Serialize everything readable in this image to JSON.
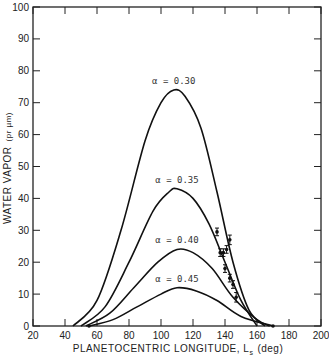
{
  "chart_data": {
    "type": "line",
    "title": "",
    "xlabel": "PLANETOCENTRIC LONGITUDE, Ls (deg)",
    "ylabel": "WATER VAPOR (pr µm)",
    "xlim": [
      20,
      200
    ],
    "ylim": [
      0,
      100
    ],
    "xticks": [
      20,
      40,
      60,
      80,
      100,
      120,
      140,
      160,
      180,
      200
    ],
    "yticks": [
      0,
      10,
      20,
      30,
      40,
      50,
      60,
      70,
      80,
      90,
      100
    ],
    "grid": false,
    "series": [
      {
        "name": "α = 0.30",
        "label": "α = 0.30",
        "peak": [
          108,
          74
        ],
        "x": [
          45,
          60,
          75,
          90,
          100,
          108,
          115,
          125,
          135,
          145,
          155,
          165
        ],
        "y": [
          0,
          8,
          30,
          58,
          70,
          74,
          72,
          62,
          42,
          20,
          5,
          0
        ]
      },
      {
        "name": "α = 0.35",
        "label": "α = 0.35",
        "peak": [
          110,
          43
        ],
        "x": [
          50,
          65,
          80,
          95,
          105,
          110,
          120,
          130,
          140,
          150,
          160
        ],
        "y": [
          0,
          6,
          20,
          36,
          42,
          43,
          40,
          32,
          20,
          8,
          0
        ]
      },
      {
        "name": "α = 0.40",
        "label": "α = 0.40",
        "peak": [
          110,
          24
        ],
        "x": [
          53,
          68,
          83,
          98,
          110,
          120,
          132,
          145,
          160,
          168
        ],
        "y": [
          0,
          4,
          12,
          20,
          24,
          23,
          18,
          9,
          2,
          0
        ]
      },
      {
        "name": "α = 0.45",
        "label": "α = 0.45",
        "peak": [
          110,
          12
        ],
        "x": [
          55,
          70,
          85,
          100,
          110,
          122,
          135,
          150,
          170
        ],
        "y": [
          0,
          2,
          6,
          10,
          12,
          11,
          8,
          3,
          0
        ]
      }
    ],
    "observations": {
      "name": "Observed (with error bars)",
      "points": [
        {
          "x": 135,
          "y": 29.5,
          "err": 1.2
        },
        {
          "x": 137,
          "y": 23,
          "err": 1.2
        },
        {
          "x": 139,
          "y": 23,
          "err": 1.2
        },
        {
          "x": 141,
          "y": 24,
          "err": 1.2
        },
        {
          "x": 143,
          "y": 27,
          "err": 1.5
        },
        {
          "x": 140,
          "y": 18,
          "err": 1.2
        },
        {
          "x": 143,
          "y": 15,
          "err": 1.2
        },
        {
          "x": 145,
          "y": 13,
          "err": 1.2
        },
        {
          "x": 147,
          "y": 9,
          "err": 1.5
        },
        {
          "x": 55,
          "y": 0,
          "err": 0
        },
        {
          "x": 170,
          "y": 0,
          "err": 0
        }
      ]
    }
  },
  "labels": {
    "xlabel_main": "PLANETOCENTRIC LONGITUDE,  L",
    "xlabel_sub": "s",
    "xlabel_unit": "(deg)",
    "ylabel_main": "WATER VAPOR",
    "ylabel_unit": "(pr µm)"
  }
}
